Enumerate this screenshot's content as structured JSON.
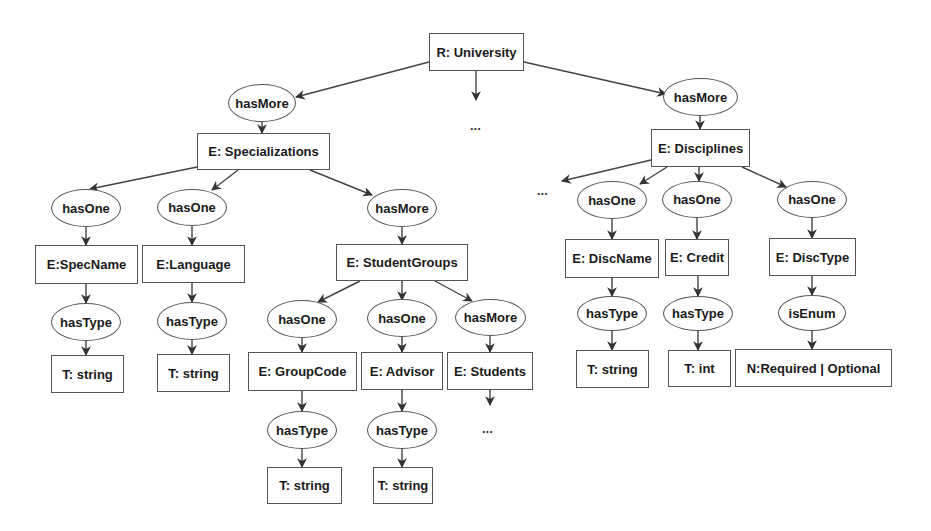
{
  "diagram": {
    "root": {
      "label": "R: University"
    },
    "nodes": {
      "root": "R: University",
      "hasmore_spec": "hasMore",
      "specializations": "E: Specializations",
      "hasone_specname": "hasOne",
      "hasone_language": "hasOne",
      "hasmore_sg": "hasMore",
      "specname": "E:SpecName",
      "language": "E:Language",
      "hastype_specname": "hasType",
      "hastype_language": "hasType",
      "type_specname": "T: string",
      "type_language": "T: string",
      "studentgroups": "E: StudentGroups",
      "hasone_groupcode": "hasOne",
      "hasone_advisor": "hasOne",
      "hasmore_students": "hasMore",
      "groupcode": "E: GroupCode",
      "advisor": "E: Advisor",
      "students": "E: Students",
      "hastype_groupcode": "hasType",
      "hastype_advisor": "hasType",
      "type_groupcode": "T: string",
      "type_advisor": "T: string",
      "hasmore_disc": "hasMore",
      "disciplines": "E: Disciplines",
      "hasone_discname": "hasOne",
      "hasone_credit": "hasOne",
      "hasone_disctype": "hasOne",
      "discname": "E: DiscName",
      "credit": "E: Credit",
      "disctype": "E: DiscType",
      "hastype_discname": "hasType",
      "hastype_credit": "hasType",
      "isenum_disctype": "isEnum",
      "type_discname": "T: string",
      "type_credit": "T: int",
      "enum_disctype": "N:Required | Optional"
    },
    "ellipses": {
      "root_middle": "...",
      "disciplines_left": "...",
      "students_below": "..."
    },
    "colors": {
      "stroke": "#555555",
      "text": "#1a1a1a",
      "background": "#ffffff"
    }
  }
}
